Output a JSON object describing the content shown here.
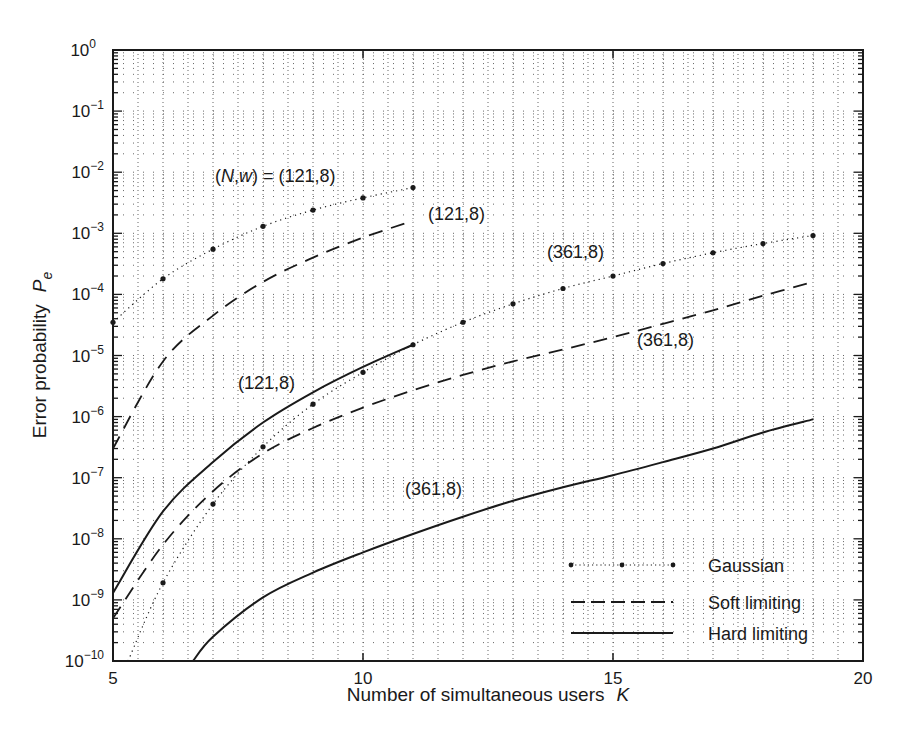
{
  "chart_data": {
    "type": "line",
    "title": "",
    "xlabel": "Number of simultaneous users",
    "xlabel_var": "K",
    "ylabel": "Error probability",
    "ylabel_var": "P",
    "ylabel_sub": "e",
    "xlim": [
      5,
      20
    ],
    "ylim": [
      1e-10,
      1
    ],
    "yscale": "log",
    "grid": true,
    "x_ticks": [
      5,
      10,
      15,
      20
    ],
    "x_tick_labels": [
      "5",
      "10",
      "15",
      "20"
    ],
    "y_ticks": [
      0,
      -1,
      -2,
      -3,
      -4,
      -5,
      -6,
      -7,
      -8,
      -9,
      -10
    ],
    "y_tick_labels": [
      "10^0",
      "10^-1",
      "10^-2",
      "10^-3",
      "10^-4",
      "10^-5",
      "10^-6",
      "10^-7",
      "10^-8",
      "10^-9",
      "10^-10"
    ],
    "legend_position": "lower right",
    "legend": [
      {
        "label": "Gaussian",
        "style": "dotted-markers"
      },
      {
        "label": "Soft limiting",
        "style": "dashed"
      },
      {
        "label": "Hard limiting",
        "style": "solid"
      }
    ],
    "series": [
      {
        "name": "Gaussian (121,8)",
        "style": "dotted-markers",
        "x": [
          5,
          6,
          7,
          8,
          9,
          10,
          11
        ],
        "values": [
          3.5e-05,
          0.00018,
          0.00055,
          0.0013,
          0.0024,
          0.0038,
          0.0056
        ]
      },
      {
        "name": "Soft limiting (121,8)",
        "style": "dashed",
        "x": [
          5,
          6,
          7,
          8,
          9,
          10,
          11
        ],
        "values": [
          3e-07,
          8e-06,
          4.5e-05,
          0.00016,
          0.0004,
          0.00085,
          0.0016
        ]
      },
      {
        "name": "Hard limiting (121,8)",
        "style": "solid",
        "x": [
          5,
          6,
          7,
          8,
          9,
          10,
          11
        ],
        "values": [
          1.3e-09,
          2.8e-08,
          1.8e-07,
          8e-07,
          2.5e-06,
          6.5e-06,
          1.5e-05
        ]
      },
      {
        "name": "Gaussian (361,8)",
        "style": "dotted-markers",
        "x": [
          5.3,
          6,
          7,
          8,
          9,
          10,
          11,
          12,
          13,
          14,
          15,
          16,
          17,
          18,
          19
        ],
        "values": [
          1e-10,
          1.9e-09,
          3.7e-08,
          3.2e-07,
          1.6e-06,
          5.3e-06,
          1.5e-05,
          3.5e-05,
          7e-05,
          0.000125,
          0.0002,
          0.00032,
          0.00048,
          0.00068,
          0.00092
        ]
      },
      {
        "name": "Soft limiting (361,8)",
        "style": "dashed",
        "x": [
          5,
          6,
          7,
          8,
          9,
          10,
          11,
          12,
          13,
          14,
          15,
          16,
          17,
          18,
          19
        ],
        "values": [
          5e-10,
          8e-09,
          6e-08,
          2.5e-07,
          6.5e-07,
          1.4e-06,
          2.7e-06,
          4.8e-06,
          8e-06,
          1.25e-05,
          2e-05,
          3.3e-05,
          5.5e-05,
          9.5e-05,
          0.00016
        ]
      },
      {
        "name": "Hard limiting (361,8)",
        "style": "solid",
        "x": [
          6.6,
          7,
          8,
          9,
          10,
          11,
          12,
          13,
          14,
          15,
          16,
          17,
          18,
          19
        ],
        "values": [
          1e-10,
          2.5e-10,
          1.1e-09,
          2.8e-09,
          6e-09,
          1.2e-08,
          2.3e-08,
          4.2e-08,
          7e-08,
          1.1e-07,
          1.8e-07,
          3e-07,
          5.5e-07,
          9e-07
        ]
      }
    ],
    "annotations": [
      {
        "text": "(N,w) = (121,8)",
        "x": 8.25,
        "y": 0.0075
      },
      {
        "text": "(121,8)",
        "x": 11.5,
        "y": 0.0011
      },
      {
        "text": "(361,8)",
        "x": 13.2,
        "y": 0.00032
      },
      {
        "text": "(361,8)",
        "x": 16.5,
        "y": 6e-06
      },
      {
        "text": "(121,8)",
        "x": 7.6,
        "y": 1.7e-06
      },
      {
        "text": "(361,8)",
        "x": 11.1,
        "y": 6e-08
      }
    ]
  },
  "labels": {
    "annot_nw_prefix": "(",
    "annot_N": "N",
    "annot_comma": ",",
    "annot_w": "w",
    "annot_nw_suffix": ") = (121,8)",
    "a121_soft": "(121,8)",
    "a361_gauss": "(361,8)",
    "a361_soft": "(361,8)",
    "a121_hard": "(121,8)",
    "a361_hard": "(361,8)"
  }
}
